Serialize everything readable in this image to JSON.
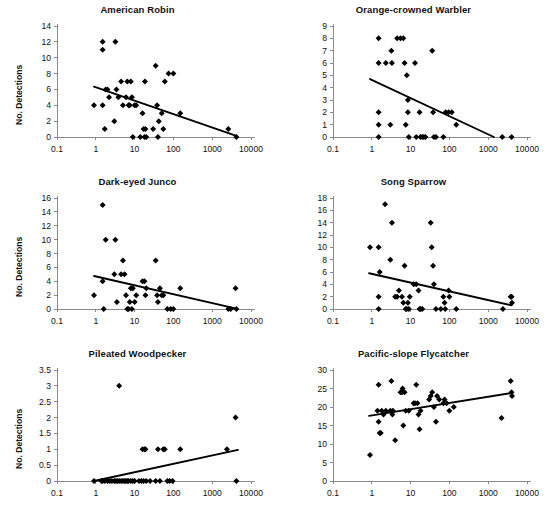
{
  "figure": {
    "panel_count": 6,
    "marker": "filled-diamond",
    "marker_color": "#000000",
    "trendline_color": "#000000",
    "axis_color": "#8a8a8a",
    "background": "#ffffff"
  },
  "shared": {
    "ylabel": "No. Detections",
    "x_ticks": [
      "0.1",
      "1",
      "10",
      "100",
      "1000",
      "10000"
    ],
    "x_tick_values": [
      0.1,
      1,
      10,
      100,
      1000,
      10000
    ],
    "xscale": "log",
    "xlim": [
      0.1,
      10000
    ]
  },
  "chart_data": [
    {
      "type": "scatter",
      "title": "American Robin",
      "xlabel": "",
      "ylabel": "No. Detections",
      "xscale": "log",
      "xlim": [
        0.1,
        10000
      ],
      "ylim": [
        0,
        14
      ],
      "yticks": [
        0,
        2,
        4,
        6,
        8,
        10,
        12,
        14
      ],
      "xticks": [
        0.1,
        1,
        10,
        100,
        1000,
        10000
      ],
      "grid": false,
      "legend": "none",
      "points": [
        [
          0.9,
          4
        ],
        [
          1.5,
          11
        ],
        [
          1.5,
          12
        ],
        [
          1.5,
          4
        ],
        [
          1.7,
          1
        ],
        [
          1.8,
          6
        ],
        [
          2.0,
          6
        ],
        [
          2.2,
          5
        ],
        [
          3.0,
          2
        ],
        [
          3.2,
          12
        ],
        [
          3.4,
          6
        ],
        [
          3.8,
          5
        ],
        [
          4.5,
          7
        ],
        [
          5.0,
          4
        ],
        [
          6.0,
          5
        ],
        [
          6.5,
          7
        ],
        [
          7.0,
          4
        ],
        [
          7.5,
          4
        ],
        [
          8.0,
          7
        ],
        [
          8.5,
          5
        ],
        [
          9.0,
          0
        ],
        [
          10.0,
          4
        ],
        [
          11.0,
          4
        ],
        [
          14.0,
          0
        ],
        [
          16.0,
          3
        ],
        [
          17.0,
          1
        ],
        [
          18.0,
          0
        ],
        [
          18.5,
          7
        ],
        [
          19.0,
          1
        ],
        [
          20.0,
          0
        ],
        [
          30.0,
          1
        ],
        [
          35.0,
          9
        ],
        [
          38.0,
          4
        ],
        [
          40.0,
          0
        ],
        [
          42.0,
          2
        ],
        [
          50.0,
          3
        ],
        [
          55.0,
          1
        ],
        [
          60.0,
          7
        ],
        [
          75.0,
          8
        ],
        [
          100.0,
          8
        ],
        [
          150.0,
          3
        ],
        [
          2600.0,
          1
        ],
        [
          4200.0,
          0
        ]
      ],
      "trendline": {
        "x1": 0.9,
        "y1": 6.35,
        "x2": 4200,
        "y2": 0.15,
        "slope_sign": "negative"
      }
    },
    {
      "type": "scatter",
      "title": "Orange-crowned Warbler",
      "xlabel": "",
      "ylabel": "",
      "xscale": "log",
      "xlim": [
        0.1,
        10000
      ],
      "ylim": [
        0,
        9
      ],
      "yticks": [
        0,
        1,
        2,
        3,
        4,
        5,
        6,
        7,
        8,
        9
      ],
      "xticks": [
        0.1,
        1,
        10,
        100,
        1000,
        10000
      ],
      "grid": false,
      "legend": "none",
      "points": [
        [
          1.5,
          6
        ],
        [
          1.5,
          8
        ],
        [
          1.5,
          2
        ],
        [
          1.5,
          1
        ],
        [
          1.5,
          0
        ],
        [
          2.3,
          6
        ],
        [
          3.0,
          1
        ],
        [
          3.2,
          7
        ],
        [
          3.3,
          6
        ],
        [
          4.5,
          8
        ],
        [
          5.5,
          8
        ],
        [
          6.5,
          8
        ],
        [
          7.0,
          6
        ],
        [
          7.5,
          1
        ],
        [
          8.0,
          5
        ],
        [
          8.5,
          3
        ],
        [
          8.5,
          2
        ],
        [
          9.0,
          0
        ],
        [
          13.0,
          6
        ],
        [
          14.0,
          0
        ],
        [
          17.0,
          2
        ],
        [
          18.0,
          0
        ],
        [
          20.0,
          0
        ],
        [
          22.0,
          0
        ],
        [
          24.0,
          0
        ],
        [
          36.0,
          7
        ],
        [
          38.0,
          2
        ],
        [
          40.0,
          0
        ],
        [
          45.0,
          0
        ],
        [
          70.0,
          0
        ],
        [
          80.0,
          2
        ],
        [
          95.0,
          2
        ],
        [
          115.0,
          2
        ],
        [
          150.0,
          1
        ],
        [
          2300.0,
          0
        ],
        [
          4000.0,
          0
        ]
      ],
      "trendline": {
        "x1": 0.9,
        "y1": 4.7,
        "x2": 1400,
        "y2": 0.0,
        "slope_sign": "negative"
      }
    },
    {
      "type": "scatter",
      "title": "Dark-eyed Junco",
      "xlabel": "",
      "ylabel": "No. Detections",
      "xscale": "log",
      "xlim": [
        0.1,
        10000
      ],
      "ylim": [
        0,
        16
      ],
      "yticks": [
        0,
        2,
        4,
        6,
        8,
        10,
        12,
        14,
        16
      ],
      "xticks": [
        0.1,
        1,
        10,
        100,
        1000,
        10000
      ],
      "grid": false,
      "legend": "none",
      "points": [
        [
          0.9,
          2
        ],
        [
          1.5,
          15
        ],
        [
          1.5,
          4
        ],
        [
          1.6,
          0
        ],
        [
          1.8,
          10
        ],
        [
          3.0,
          5
        ],
        [
          3.2,
          10
        ],
        [
          3.5,
          1
        ],
        [
          4.5,
          5
        ],
        [
          5.0,
          7
        ],
        [
          5.5,
          5
        ],
        [
          6.0,
          2
        ],
        [
          6.5,
          0
        ],
        [
          7.0,
          0
        ],
        [
          7.5,
          1
        ],
        [
          8.0,
          3
        ],
        [
          8.5,
          0
        ],
        [
          9.0,
          3
        ],
        [
          10.0,
          1
        ],
        [
          11.0,
          2
        ],
        [
          16.0,
          4
        ],
        [
          18.0,
          4
        ],
        [
          19.0,
          2
        ],
        [
          20.0,
          3
        ],
        [
          35.0,
          7
        ],
        [
          38.0,
          2
        ],
        [
          40.0,
          1
        ],
        [
          45.0,
          3
        ],
        [
          50.0,
          2
        ],
        [
          55.0,
          2
        ],
        [
          70.0,
          0
        ],
        [
          85.0,
          0
        ],
        [
          100.0,
          0
        ],
        [
          150.0,
          3
        ],
        [
          2600.0,
          0
        ],
        [
          3000.0,
          0
        ],
        [
          4000.0,
          3
        ],
        [
          4200.0,
          0
        ]
      ],
      "trendline": {
        "x1": 0.9,
        "y1": 4.75,
        "x2": 4200,
        "y2": 0.05,
        "slope_sign": "negative"
      }
    },
    {
      "type": "scatter",
      "title": "Song Sparrow",
      "xlabel": "",
      "ylabel": "",
      "xscale": "log",
      "xlim": [
        0.1,
        10000
      ],
      "ylim": [
        0,
        18
      ],
      "yticks": [
        0,
        2,
        4,
        6,
        8,
        10,
        12,
        14,
        16,
        18
      ],
      "xticks": [
        0.1,
        1,
        10,
        100,
        1000,
        10000
      ],
      "grid": false,
      "legend": "none",
      "points": [
        [
          0.9,
          10
        ],
        [
          1.5,
          10
        ],
        [
          1.5,
          2
        ],
        [
          1.5,
          0
        ],
        [
          1.6,
          6
        ],
        [
          2.2,
          17
        ],
        [
          3.0,
          8
        ],
        [
          3.3,
          14
        ],
        [
          4.0,
          2
        ],
        [
          4.5,
          2
        ],
        [
          5.0,
          3
        ],
        [
          6.0,
          2
        ],
        [
          6.5,
          1
        ],
        [
          7.0,
          7
        ],
        [
          7.5,
          0
        ],
        [
          8.0,
          0
        ],
        [
          8.5,
          1
        ],
        [
          9.0,
          0
        ],
        [
          9.5,
          2
        ],
        [
          12.0,
          4
        ],
        [
          14.0,
          4
        ],
        [
          16.0,
          3
        ],
        [
          17.0,
          0
        ],
        [
          18.0,
          0
        ],
        [
          20.0,
          0
        ],
        [
          33.0,
          14
        ],
        [
          35.0,
          10
        ],
        [
          38.0,
          7
        ],
        [
          40.0,
          4
        ],
        [
          45.0,
          0
        ],
        [
          60.0,
          0
        ],
        [
          70.0,
          2
        ],
        [
          75.0,
          1
        ],
        [
          78.0,
          0
        ],
        [
          95.0,
          3
        ],
        [
          100.0,
          2
        ],
        [
          150.0,
          0
        ],
        [
          2400.0,
          0
        ],
        [
          3800.0,
          2
        ],
        [
          4000.0,
          2
        ],
        [
          4100.0,
          1
        ]
      ],
      "trendline": {
        "x1": 0.85,
        "y1": 5.8,
        "x2": 4000,
        "y2": 0.6,
        "slope_sign": "negative"
      }
    },
    {
      "type": "scatter",
      "title": "Pileated Woodpecker",
      "xlabel": "",
      "ylabel": "No. Detections",
      "xscale": "log",
      "xlim": [
        0.1,
        10000
      ],
      "ylim": [
        0,
        3.5
      ],
      "yticks": [
        0,
        0.5,
        1,
        1.5,
        2,
        2.5,
        3,
        3.5
      ],
      "xticks": [
        0.1,
        1,
        10,
        100,
        1000,
        10000
      ],
      "grid": false,
      "legend": "none",
      "points": [
        [
          0.9,
          0
        ],
        [
          1.4,
          0
        ],
        [
          1.5,
          0
        ],
        [
          1.7,
          0
        ],
        [
          2.0,
          0
        ],
        [
          2.3,
          0
        ],
        [
          2.6,
          0
        ],
        [
          3.0,
          0
        ],
        [
          3.3,
          0
        ],
        [
          3.6,
          0
        ],
        [
          4.0,
          3
        ],
        [
          4.0,
          0
        ],
        [
          4.5,
          0
        ],
        [
          5.0,
          0
        ],
        [
          5.5,
          0
        ],
        [
          6.0,
          0
        ],
        [
          6.5,
          0
        ],
        [
          7.0,
          0
        ],
        [
          8.0,
          0
        ],
        [
          9.0,
          0
        ],
        [
          10.0,
          0
        ],
        [
          13.0,
          0
        ],
        [
          15.0,
          0
        ],
        [
          16.0,
          1
        ],
        [
          17.0,
          0
        ],
        [
          18.0,
          1
        ],
        [
          19.0,
          1
        ],
        [
          20.0,
          0
        ],
        [
          25.0,
          0
        ],
        [
          35.0,
          0
        ],
        [
          40.0,
          1
        ],
        [
          45.0,
          0
        ],
        [
          55.0,
          1
        ],
        [
          60.0,
          1
        ],
        [
          70.0,
          0
        ],
        [
          80.0,
          0
        ],
        [
          95.0,
          0
        ],
        [
          150.0,
          1
        ],
        [
          2400.0,
          1
        ],
        [
          4000.0,
          2
        ],
        [
          4200.0,
          0
        ]
      ],
      "trendline": {
        "x1": 0.9,
        "y1": 0.0,
        "x2": 4600,
        "y2": 0.98,
        "slope_sign": "positive"
      }
    },
    {
      "type": "scatter",
      "title": "Pacific-slope Flycatcher",
      "xlabel": "",
      "ylabel": "",
      "xscale": "log",
      "xlim": [
        0.1,
        10000
      ],
      "ylim": [
        0,
        30
      ],
      "yticks": [
        0,
        5,
        10,
        15,
        20,
        25,
        30
      ],
      "xticks": [
        0.1,
        1,
        10,
        100,
        1000,
        10000
      ],
      "grid": false,
      "legend": "none",
      "points": [
        [
          0.9,
          7
        ],
        [
          1.4,
          19
        ],
        [
          1.5,
          26
        ],
        [
          1.5,
          16
        ],
        [
          1.6,
          13
        ],
        [
          1.7,
          13
        ],
        [
          1.8,
          19
        ],
        [
          2.0,
          18
        ],
        [
          2.3,
          19
        ],
        [
          3.0,
          19
        ],
        [
          3.2,
          27
        ],
        [
          3.4,
          18
        ],
        [
          3.5,
          19
        ],
        [
          4.0,
          11
        ],
        [
          5.5,
          24
        ],
        [
          6.0,
          24
        ],
        [
          6.2,
          25
        ],
        [
          6.5,
          15
        ],
        [
          7.0,
          24
        ],
        [
          7.5,
          19
        ],
        [
          9.0,
          19
        ],
        [
          12.0,
          21
        ],
        [
          13.0,
          21
        ],
        [
          14.0,
          26
        ],
        [
          15.0,
          21
        ],
        [
          16.0,
          18
        ],
        [
          17.0,
          14
        ],
        [
          18.0,
          19
        ],
        [
          30.0,
          22
        ],
        [
          33.0,
          23
        ],
        [
          36.0,
          24
        ],
        [
          40.0,
          20
        ],
        [
          45.0,
          16
        ],
        [
          48.0,
          23
        ],
        [
          55.0,
          22
        ],
        [
          70.0,
          21
        ],
        [
          75.0,
          22
        ],
        [
          85.0,
          21
        ],
        [
          100.0,
          19
        ],
        [
          130.0,
          20
        ],
        [
          2200.0,
          17
        ],
        [
          3800.0,
          27
        ],
        [
          4000.0,
          24
        ],
        [
          4100.0,
          23
        ]
      ],
      "trendline": {
        "x1": 0.85,
        "y1": 17.6,
        "x2": 4200,
        "y2": 23.8,
        "slope_sign": "positive"
      }
    }
  ]
}
